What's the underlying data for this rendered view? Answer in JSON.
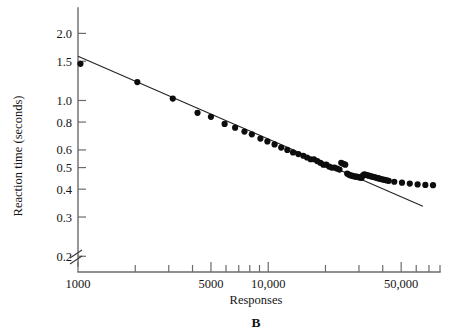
{
  "figure": {
    "panel_letter": "B"
  },
  "chart_data": {
    "type": "scatter",
    "title": "",
    "subtitle": "",
    "xlabel": "Responses",
    "ylabel": "Reaction time (seconds)",
    "xscale": "log",
    "yscale": "log",
    "xlim": [
      1000,
      80000
    ],
    "ylim": [
      0.17,
      2.6
    ],
    "grid": false,
    "legend": null,
    "axis_break": {
      "present": true,
      "axis": "origin",
      "symbol": "double-slash"
    },
    "xticks_major": [
      {
        "value": 1000,
        "label": "1000"
      },
      {
        "value": 5000,
        "label": "5000"
      },
      {
        "value": 10000,
        "label": "10,000"
      },
      {
        "value": 50000,
        "label": "50,000"
      }
    ],
    "xticks_minor": [
      2000,
      3000,
      4000,
      6000,
      7000,
      8000,
      9000,
      20000,
      30000,
      40000,
      60000,
      70000,
      80000
    ],
    "yticks": [
      {
        "value": 2.0,
        "label": "2.0"
      },
      {
        "value": 1.5,
        "label": "1.5"
      },
      {
        "value": 1.0,
        "label": "1.0"
      },
      {
        "value": 0.8,
        "label": "0.8"
      },
      {
        "value": 0.6,
        "label": "0.6"
      },
      {
        "value": 0.5,
        "label": "0.5"
      },
      {
        "value": 0.4,
        "label": "0.4"
      },
      {
        "value": 0.3,
        "label": "0.3"
      },
      {
        "value": 0.2,
        "label": "0.2"
      }
    ],
    "series": [
      {
        "name": "Reaction time vs responses",
        "marker": "filled-circle",
        "color": "#0d0d0d",
        "points": [
          [
            1030,
            1.46
          ],
          [
            2050,
            1.21
          ],
          [
            3150,
            1.02
          ],
          [
            4250,
            0.88
          ],
          [
            5000,
            0.845
          ],
          [
            5900,
            0.785
          ],
          [
            6700,
            0.755
          ],
          [
            7500,
            0.725
          ],
          [
            8200,
            0.705
          ],
          [
            9100,
            0.675
          ],
          [
            9900,
            0.655
          ],
          [
            10800,
            0.635
          ],
          [
            11700,
            0.615
          ],
          [
            12600,
            0.6
          ],
          [
            13500,
            0.585
          ],
          [
            14400,
            0.575
          ],
          [
            15300,
            0.565
          ],
          [
            16000,
            0.555
          ],
          [
            16700,
            0.545
          ],
          [
            17400,
            0.545
          ],
          [
            18100,
            0.535
          ],
          [
            18800,
            0.525
          ],
          [
            19500,
            0.515
          ],
          [
            20200,
            0.515
          ],
          [
            20900,
            0.505
          ],
          [
            21600,
            0.5
          ],
          [
            22300,
            0.5
          ],
          [
            23000,
            0.495
          ],
          [
            23700,
            0.49
          ],
          [
            24200,
            0.525
          ],
          [
            24800,
            0.52
          ],
          [
            25400,
            0.515
          ],
          [
            26000,
            0.47
          ],
          [
            26500,
            0.465
          ],
          [
            27000,
            0.462
          ],
          [
            27500,
            0.46
          ],
          [
            28000,
            0.458
          ],
          [
            28500,
            0.456
          ],
          [
            29000,
            0.455
          ],
          [
            29500,
            0.454
          ],
          [
            30000,
            0.452
          ],
          [
            30500,
            0.451
          ],
          [
            31000,
            0.45
          ],
          [
            31500,
            0.462
          ],
          [
            32000,
            0.466
          ],
          [
            32600,
            0.464
          ],
          [
            33200,
            0.462
          ],
          [
            33800,
            0.46
          ],
          [
            34400,
            0.458
          ],
          [
            35000,
            0.456
          ],
          [
            35700,
            0.454
          ],
          [
            36400,
            0.452
          ],
          [
            37100,
            0.45
          ],
          [
            37800,
            0.448
          ],
          [
            38500,
            0.446
          ],
          [
            39300,
            0.444
          ],
          [
            40100,
            0.442
          ],
          [
            41000,
            0.44
          ],
          [
            42000,
            0.438
          ],
          [
            43000,
            0.436
          ],
          [
            46000,
            0.432
          ],
          [
            50500,
            0.428
          ],
          [
            55500,
            0.424
          ],
          [
            61000,
            0.42
          ],
          [
            67000,
            0.418
          ],
          [
            73500,
            0.417
          ]
        ]
      }
    ],
    "fit_line": {
      "name": "power-law fit",
      "x_start": 1000,
      "x_end": 65000,
      "y_start": 1.58,
      "y_end": 0.335
    }
  }
}
